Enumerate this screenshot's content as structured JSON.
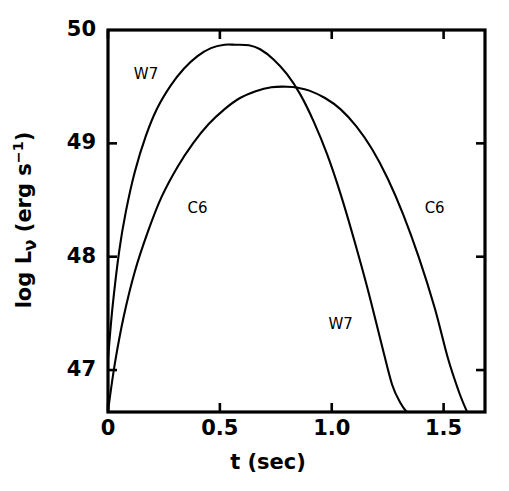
{
  "chart_data": {
    "type": "line",
    "title": "",
    "xlabel": "t  (sec)",
    "ylabel": "log Lν (erg s⁻¹)",
    "ylabel_parts": {
      "prefix": "log L",
      "subscript": "ν",
      "unit_open": " (erg s",
      "superscript": "−1",
      "unit_close": ")"
    },
    "xlim": [
      0.0,
      1.685
    ],
    "ylim": [
      46.63,
      50.0
    ],
    "grid": false,
    "legend": "inline-annotations",
    "xticks": [
      0,
      0.5,
      1.0,
      1.5
    ],
    "xtick_labels": [
      "0",
      "0.5",
      "1.0",
      "1.5"
    ],
    "yticks": [
      47,
      48,
      49,
      50
    ],
    "ytick_labels": [
      "47",
      "48",
      "49",
      "50"
    ],
    "series": [
      {
        "name": "W7",
        "color": "#000000",
        "x": [
          0.0,
          0.02,
          0.05,
          0.08,
          0.12,
          0.17,
          0.22,
          0.28,
          0.34,
          0.4,
          0.46,
          0.52,
          0.57,
          0.63,
          0.68,
          0.74,
          0.8,
          0.86,
          0.92,
          0.98,
          1.04,
          1.1,
          1.16,
          1.22,
          1.27,
          1.31,
          1.335
        ],
        "y": [
          47.1,
          47.55,
          48.05,
          48.4,
          48.75,
          49.07,
          49.31,
          49.51,
          49.66,
          49.77,
          49.84,
          49.87,
          49.87,
          49.865,
          49.83,
          49.74,
          49.61,
          49.43,
          49.19,
          48.9,
          48.55,
          48.15,
          47.72,
          47.25,
          46.87,
          46.7,
          46.63
        ]
      },
      {
        "name": "C6",
        "color": "#000000",
        "x": [
          0.0,
          0.03,
          0.07,
          0.12,
          0.18,
          0.24,
          0.31,
          0.38,
          0.45,
          0.52,
          0.59,
          0.66,
          0.73,
          0.8,
          0.85,
          0.9,
          0.97,
          1.04,
          1.11,
          1.18,
          1.25,
          1.32,
          1.39,
          1.46,
          1.52,
          1.57,
          1.605
        ],
        "y": [
          46.64,
          47.05,
          47.47,
          47.87,
          48.23,
          48.53,
          48.79,
          49.0,
          49.17,
          49.3,
          49.4,
          49.46,
          49.495,
          49.5,
          49.49,
          49.465,
          49.4,
          49.3,
          49.15,
          48.95,
          48.69,
          48.37,
          47.99,
          47.55,
          47.1,
          46.8,
          46.63
        ]
      }
    ],
    "annotations": [
      {
        "text": "W7",
        "x": 0.17,
        "y": 49.6,
        "series": "W7",
        "position": "upper-left"
      },
      {
        "text": "C6",
        "x": 0.4,
        "y": 48.42,
        "series": "C6",
        "position": "mid-left"
      },
      {
        "text": "C6",
        "x": 1.46,
        "y": 48.42,
        "series": "C6",
        "position": "mid-right"
      },
      {
        "text": "W7",
        "x": 1.04,
        "y": 47.4,
        "series": "W7",
        "position": "lower-right"
      }
    ]
  },
  "axes": {
    "frame_color": "#000000",
    "curve_color": "#000000",
    "background": "#ffffff"
  }
}
